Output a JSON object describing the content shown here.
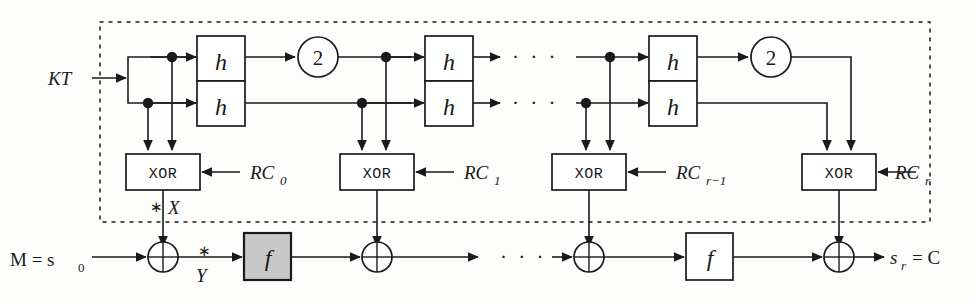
{
  "figure": {
    "input_label": "KT",
    "plaintext_label": "M = s",
    "plaintext_sub": "0",
    "ciphertext_label": "s",
    "ciphertext_sub": "r",
    "ciphertext_eq": "= C",
    "tap_x_star": "∗",
    "tap_x_label": "X",
    "tap_y_star": "∗",
    "tap_y_label": "Y",
    "ellipsis": "· · ·",
    "xor_box_label": "XOR",
    "h_label": "h",
    "f_label": "f",
    "doubling_label": "2",
    "colors": {
      "line": "#1a1a1a",
      "box_fill": "#ffffff",
      "highlight_fill": "#c8c8c8",
      "background": "#fdfdfc"
    }
  },
  "key_schedule": {
    "rounds": [
      {
        "id": "round-0",
        "h_pair_label": "h",
        "doubling": "2",
        "xor_label": "XOR",
        "rc_label": "RC",
        "rc_sub": "0"
      },
      {
        "id": "round-1",
        "h_pair_label": "h",
        "doubling": "",
        "xor_label": "XOR",
        "rc_label": "RC",
        "rc_sub": "1"
      },
      {
        "id": "round-r-minus-1",
        "h_pair_label": "h",
        "doubling": "",
        "xor_label": "XOR",
        "rc_label": "RC",
        "rc_sub": "r−1"
      },
      {
        "id": "round-r",
        "h_pair_label": "h",
        "doubling": "2",
        "xor_label": "XOR",
        "rc_label": "RC",
        "rc_sub": "r"
      }
    ]
  },
  "data_path": {
    "rounds": [
      {
        "id": "f-round-1",
        "f_label": "f",
        "highlighted": true
      },
      {
        "id": "f-round-r",
        "f_label": "f",
        "highlighted": false
      }
    ]
  }
}
